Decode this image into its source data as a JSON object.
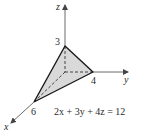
{
  "diagram": {
    "axes": {
      "x_label": "x",
      "y_label": "y",
      "z_label": "z"
    },
    "intercepts": {
      "x": "6",
      "y": "4",
      "z": "3"
    },
    "equation": "2x + 3y + 4z = 12",
    "colors": {
      "plane_fill": "#d9d9d9",
      "edge": "#1a1a1a",
      "axis": "#444444"
    }
  }
}
